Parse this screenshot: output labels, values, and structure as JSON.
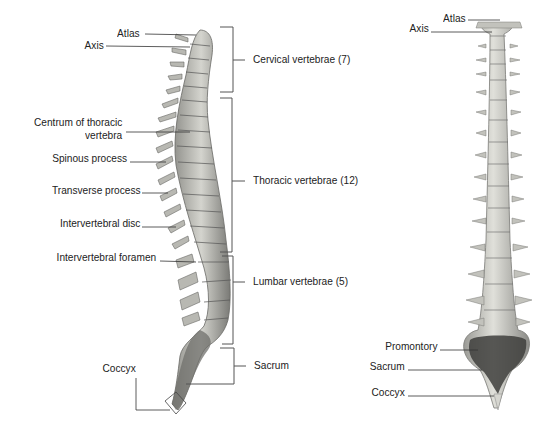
{
  "diagram": {
    "lateral_view": {
      "left_labels": {
        "atlas": "Atlas",
        "axis": "Axis",
        "centrum_line1": "Centrum of thoracic",
        "centrum_line2": "vertebra",
        "spinous": "Spinous process",
        "transverse": "Transverse process",
        "disc": "Intervertebral disc",
        "foramen": "Intervertebral foramen",
        "coccyx": "Coccyx"
      },
      "regions": {
        "cervical": "Cervical vertebrae (7)",
        "thoracic": "Thoracic vertebrae (12)",
        "lumbar": "Lumbar vertebrae (5)",
        "sacrum": "Sacrum"
      }
    },
    "anterior_view": {
      "labels": {
        "atlas": "Atlas",
        "axis": "Axis",
        "promontory": "Promontory",
        "sacrum": "Sacrum",
        "coccyx": "Coccyx"
      }
    },
    "colors": {
      "bone_light": "#d8d8d2",
      "bone_mid": "#a8a8a2",
      "bone_dark": "#5a5a58",
      "leader_line": "#333333",
      "bracket": "#555555"
    }
  }
}
